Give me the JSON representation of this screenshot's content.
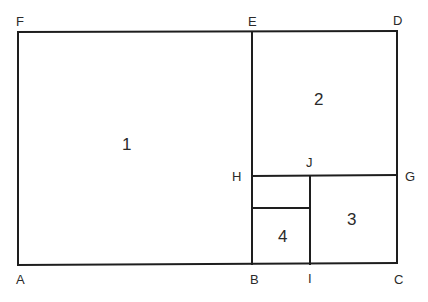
{
  "diagram": {
    "type": "golden-rectangle-subdivision",
    "point_labels": {
      "A": "A",
      "B": "B",
      "C": "C",
      "D": "D",
      "E": "E",
      "F": "F",
      "G": "G",
      "H": "H",
      "I": "I",
      "J": "J"
    },
    "region_labels": [
      "1",
      "2",
      "3",
      "4"
    ],
    "line_color": "#1e1e1e"
  }
}
